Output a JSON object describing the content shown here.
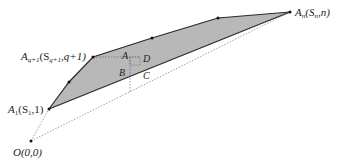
{
  "diagram": {
    "type": "geometry",
    "colors": {
      "fill": "#b8b8b8",
      "stroke": "#2a2a2a",
      "dotted": "#888888",
      "text": "#222222"
    },
    "points": {
      "O": {
        "label": "O(0,0)",
        "x": 31,
        "y": 141
      },
      "A1": {
        "label_main": "A",
        "label_sub": "1",
        "label_rest": "(S",
        "label_sub2": "1",
        "label_end": ",1)",
        "x": 49,
        "y": 109
      },
      "Aq1": {
        "label_main": "A",
        "label_sub": "q+1",
        "label_rest": "(S",
        "label_sub2": "q+1",
        "label_end": ",q+1)",
        "x": 93,
        "y": 57
      },
      "An": {
        "label_main": "A",
        "label_sub": "n",
        "label_rest": "(S",
        "label_sub2": "n",
        "label_end": ",n)",
        "x": 290,
        "y": 12
      }
    },
    "inner_labels": {
      "A": "A",
      "B": "B",
      "C": "C",
      "D": "D"
    }
  }
}
